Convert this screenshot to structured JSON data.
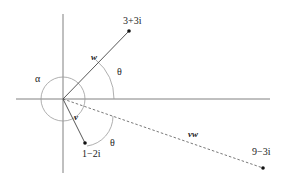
{
  "diagram": {
    "type": "complex-plane-vector-multiplication",
    "colors": {
      "axis": "#808080",
      "vector": "#444444",
      "arc": "#9a9a9a",
      "point": "#111111",
      "text": "#222222"
    },
    "points": {
      "w_end": {
        "label": "3+3i"
      },
      "v_end": {
        "label": "1−2i"
      },
      "vw_end": {
        "label": "9−3i"
      }
    },
    "vectors": {
      "w": {
        "label": "w"
      },
      "v": {
        "label": "v"
      },
      "vw": {
        "label": "vw",
        "style": "dashed"
      }
    },
    "angles": {
      "alpha": {
        "label": "α"
      },
      "theta_upper": {
        "label": "θ"
      },
      "theta_lower": {
        "label": "θ"
      }
    }
  }
}
